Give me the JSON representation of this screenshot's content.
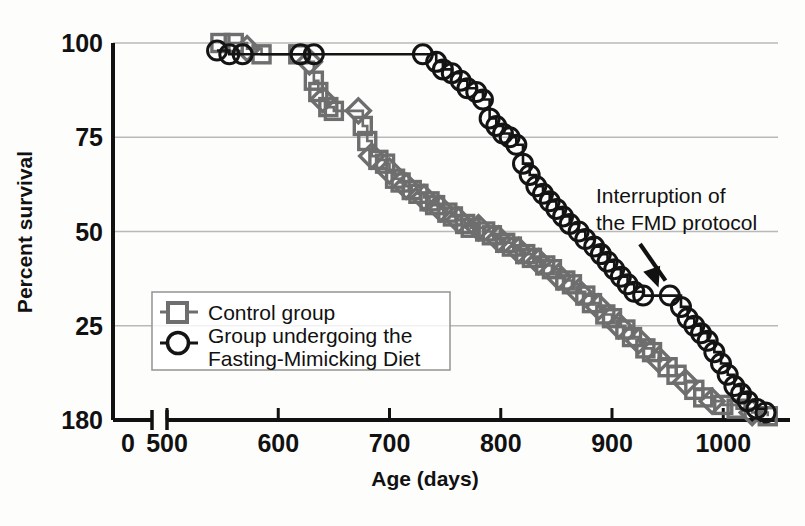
{
  "chart_data": {
    "type": "line",
    "title": "",
    "xlabel": "Age (days)",
    "ylabel": "Percent survival",
    "xlim": [
      500,
      1060
    ],
    "ylim": [
      0,
      100
    ],
    "xticks": [
      "0",
      "500",
      "600",
      "700",
      "800",
      "900",
      "1000"
    ],
    "xtick_values": [
      0,
      500,
      600,
      700,
      800,
      900,
      1000
    ],
    "yticks": [
      "180",
      "25",
      "50",
      "75",
      "100"
    ],
    "ytick_values": [
      0,
      25,
      50,
      75,
      100
    ],
    "axis_break": true,
    "grid": "horizontal",
    "legend_position": "lower-left-inside",
    "series": [
      {
        "name": "Control group",
        "marker": "square",
        "color": "#6e6e6e",
        "points": [
          [
            548,
            100
          ],
          [
            560,
            100
          ],
          [
            572,
            98.5
          ],
          [
            585,
            97
          ],
          [
            618,
            97
          ],
          [
            628,
            95
          ],
          [
            632,
            90
          ],
          [
            636,
            87
          ],
          [
            640,
            85
          ],
          [
            645,
            83
          ],
          [
            650,
            82
          ],
          [
            672,
            82
          ],
          [
            676,
            78
          ],
          [
            680,
            74
          ],
          [
            684,
            70
          ],
          [
            690,
            69
          ],
          [
            696,
            68
          ],
          [
            700,
            66
          ],
          [
            705,
            64
          ],
          [
            710,
            63
          ],
          [
            715,
            62
          ],
          [
            720,
            61
          ],
          [
            726,
            60
          ],
          [
            731,
            59
          ],
          [
            736,
            58
          ],
          [
            741,
            57
          ],
          [
            746,
            56
          ],
          [
            752,
            55
          ],
          [
            757,
            54
          ],
          [
            762,
            53
          ],
          [
            768,
            52
          ],
          [
            773,
            51
          ],
          [
            780,
            51
          ],
          [
            786,
            50
          ],
          [
            792,
            49
          ],
          [
            798,
            48
          ],
          [
            804,
            47
          ],
          [
            810,
            46
          ],
          [
            816,
            45
          ],
          [
            822,
            44
          ],
          [
            828,
            43
          ],
          [
            834,
            42
          ],
          [
            840,
            41
          ],
          [
            846,
            40
          ],
          [
            852,
            38
          ],
          [
            858,
            37
          ],
          [
            864,
            36
          ],
          [
            870,
            34
          ],
          [
            876,
            33
          ],
          [
            882,
            31
          ],
          [
            888,
            30
          ],
          [
            894,
            28
          ],
          [
            900,
            27
          ],
          [
            906,
            25
          ],
          [
            912,
            24
          ],
          [
            918,
            22
          ],
          [
            924,
            21
          ],
          [
            930,
            19
          ],
          [
            936,
            18
          ],
          [
            942,
            16
          ],
          [
            950,
            14
          ],
          [
            958,
            12
          ],
          [
            966,
            10
          ],
          [
            974,
            8
          ],
          [
            982,
            6
          ],
          [
            990,
            5
          ],
          [
            1000,
            4
          ],
          [
            1012,
            3
          ],
          [
            1026,
            2
          ],
          [
            1040,
            1
          ]
        ]
      },
      {
        "name": "Group undergoing the Fasting-Mimicking Diet",
        "marker": "circle",
        "color": "#141414",
        "points": [
          [
            545,
            98
          ],
          [
            556,
            97
          ],
          [
            568,
            97
          ],
          [
            620,
            97
          ],
          [
            632,
            97
          ],
          [
            730,
            97
          ],
          [
            742,
            95
          ],
          [
            748,
            93
          ],
          [
            756,
            92
          ],
          [
            764,
            90
          ],
          [
            770,
            88
          ],
          [
            778,
            87
          ],
          [
            784,
            85
          ],
          [
            790,
            80
          ],
          [
            796,
            78
          ],
          [
            802,
            76
          ],
          [
            808,
            75
          ],
          [
            814,
            73
          ],
          [
            820,
            68
          ],
          [
            826,
            65
          ],
          [
            832,
            62
          ],
          [
            838,
            60
          ],
          [
            844,
            58
          ],
          [
            850,
            56
          ],
          [
            856,
            54
          ],
          [
            862,
            52
          ],
          [
            870,
            50
          ],
          [
            876,
            48
          ],
          [
            884,
            46
          ],
          [
            890,
            44
          ],
          [
            896,
            42
          ],
          [
            902,
            40
          ],
          [
            908,
            38
          ],
          [
            914,
            36
          ],
          [
            920,
            34
          ],
          [
            928,
            33
          ],
          [
            952,
            33
          ],
          [
            962,
            30
          ],
          [
            968,
            27
          ],
          [
            974,
            25
          ],
          [
            980,
            23
          ],
          [
            986,
            21
          ],
          [
            992,
            18
          ],
          [
            998,
            15
          ],
          [
            1004,
            12
          ],
          [
            1010,
            9
          ],
          [
            1016,
            7
          ],
          [
            1022,
            5
          ],
          [
            1030,
            3
          ],
          [
            1038,
            2
          ]
        ]
      }
    ],
    "annotations": [
      {
        "text_line1": "Interruption of",
        "text_line2": "the FMD protocol",
        "target_x": 940,
        "target_y": 33
      }
    ]
  }
}
